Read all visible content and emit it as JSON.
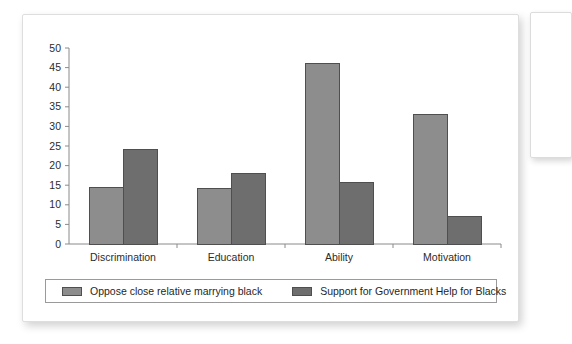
{
  "chart_data": {
    "type": "bar",
    "title": "",
    "subtitle": "",
    "xlabel": "",
    "ylabel": "",
    "ylim": [
      0,
      50
    ],
    "ytick_step": 5,
    "yticks": [
      "0",
      "5",
      "10",
      "15",
      "20",
      "25",
      "30",
      "35",
      "40",
      "45",
      "50"
    ],
    "grid": false,
    "legend_position": "bottom",
    "categories": [
      "Discrimination",
      "Education",
      "Ability",
      "Motivation"
    ],
    "series": [
      {
        "name": "Oppose close relative marrying black",
        "color": "#8d8d8d",
        "values": [
          14.5,
          14.2,
          46,
          33
        ]
      },
      {
        "name": "Support for Government Help for Blacks",
        "color": "#6e6e6e",
        "values": [
          24.2,
          18,
          15.7,
          7
        ]
      }
    ]
  },
  "legend": {
    "entries": [
      {
        "label": "Oppose close relative marrying black",
        "swatch": "#8d8d8d"
      },
      {
        "label": "Support for Government Help for Blacks",
        "swatch": "#6e6e6e"
      }
    ]
  },
  "colors": {
    "series_light": "#8d8d8d",
    "series_dark": "#6e6e6e",
    "axis": "#8a8a8a",
    "bar_outline": "#4f4f4f",
    "card_background": "#ffffff",
    "card_border": "#dedede",
    "text": "#2b2b2b"
  }
}
